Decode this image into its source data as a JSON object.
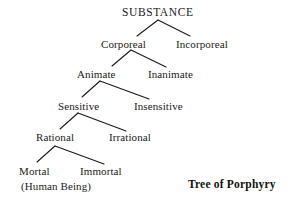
{
  "diagram": {
    "title": "Tree of Porphyry",
    "caption": "Tree of Porphyry",
    "type": "tree",
    "line_color": "#1a1a1a",
    "text_color": "#1a1a1a",
    "background_color": "#ffffff",
    "nodes": [
      {
        "id": "substance",
        "label": "SUBSTANCE",
        "level": 0,
        "x": 158,
        "y": 12
      },
      {
        "id": "corporeal",
        "label": "Corporeal",
        "level": 1,
        "x": 123,
        "y": 44
      },
      {
        "id": "incorporeal",
        "label": "Incorporeal",
        "level": 1,
        "x": 202,
        "y": 44
      },
      {
        "id": "animate",
        "label": "Animate",
        "level": 2,
        "x": 96,
        "y": 74
      },
      {
        "id": "inanimate",
        "label": "Inanimate",
        "level": 2,
        "x": 170,
        "y": 74
      },
      {
        "id": "sensitive",
        "label": "Sensitive",
        "level": 3,
        "x": 78,
        "y": 106
      },
      {
        "id": "insensitive",
        "label": "Insensitive",
        "level": 3,
        "x": 158,
        "y": 106
      },
      {
        "id": "rational",
        "label": "Rational",
        "level": 4,
        "x": 55,
        "y": 137
      },
      {
        "id": "irrational",
        "label": "Irrational",
        "level": 4,
        "x": 130,
        "y": 137
      },
      {
        "id": "mortal",
        "label": "Mortal",
        "level": 5,
        "x": 34,
        "y": 171
      },
      {
        "id": "immortal",
        "label": "Immortal",
        "level": 5,
        "x": 101,
        "y": 171
      }
    ],
    "annotations": [
      {
        "id": "human-being",
        "label": "(Human Being)",
        "x": 56,
        "y": 186
      }
    ],
    "edges": [
      {
        "from": "substance",
        "to": "corporeal",
        "x1": 158,
        "y1": 20,
        "x2": 137,
        "y2": 36
      },
      {
        "from": "substance",
        "to": "incorporeal",
        "x1": 158,
        "y1": 20,
        "x2": 190,
        "y2": 36
      },
      {
        "from": "corporeal",
        "to": "animate",
        "x1": 131,
        "y1": 50,
        "x2": 112,
        "y2": 66
      },
      {
        "from": "corporeal",
        "to": "inanimate",
        "x1": 131,
        "y1": 50,
        "x2": 166,
        "y2": 67
      },
      {
        "from": "animate",
        "to": "sensitive",
        "x1": 100,
        "y1": 81,
        "x2": 82,
        "y2": 97
      },
      {
        "from": "animate",
        "to": "insensitive",
        "x1": 100,
        "y1": 81,
        "x2": 149,
        "y2": 99
      },
      {
        "from": "sensitive",
        "to": "rational",
        "x1": 78,
        "y1": 113,
        "x2": 60,
        "y2": 129
      },
      {
        "from": "sensitive",
        "to": "irrational",
        "x1": 78,
        "y1": 113,
        "x2": 126,
        "y2": 131
      },
      {
        "from": "rational",
        "to": "mortal",
        "x1": 55,
        "y1": 146,
        "x2": 37,
        "y2": 162
      },
      {
        "from": "rational",
        "to": "immortal",
        "x1": 55,
        "y1": 146,
        "x2": 104,
        "y2": 164
      }
    ],
    "caption_position": {
      "x": 232,
      "y": 184
    }
  }
}
